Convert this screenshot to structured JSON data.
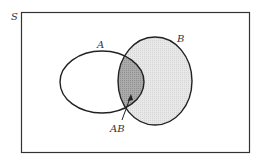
{
  "diagram": {
    "type": "venn",
    "universe_label": "S",
    "sets": [
      {
        "name": "A",
        "label": "A",
        "fill": "none"
      },
      {
        "name": "B",
        "label": "B",
        "fill": "#e6e6e6"
      }
    ],
    "intersection": {
      "label": "AB",
      "fill": "#a9a9a9"
    },
    "colors": {
      "stroke": "#222222",
      "b_fill": "#e6e6e6",
      "ab_fill": "#a9a9a9",
      "background": "#ffffff"
    }
  }
}
